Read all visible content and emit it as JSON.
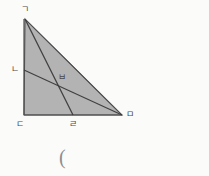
{
  "figure": {
    "background_color": "#fbfbfa",
    "fill_color": "#b3b3b3",
    "stroke_color": "#4f4f4f",
    "label_color": "#4a4a4a",
    "caption_color": "#8d8d8d",
    "width": 209,
    "height": 176
  },
  "labels": {
    "apex": "ㄱ",
    "left_leg_point": "ㄴ",
    "intersection": "ㅂ",
    "bottom_left": "ㄷ",
    "bottom_point": "ㄹ",
    "bottom_right": "ㅁ"
  },
  "caption": {
    "text": "("
  },
  "geometry": {
    "points": {
      "apex": {
        "name": "ㄱ",
        "x": 25,
        "y": 19
      },
      "bottom_left": {
        "name": "ㄷ",
        "x": 24,
        "y": 115
      },
      "bottom_right": {
        "name": "ㅁ",
        "x": 122,
        "y": 115
      },
      "left_leg_point": {
        "name": "ㄴ",
        "x": 24,
        "y": 70
      },
      "bottom_point": {
        "name": "ㄹ",
        "x": 73,
        "y": 115
      },
      "intersection": {
        "name": "ㅂ",
        "x": 62,
        "y": 82
      }
    },
    "triangle_vertices": "ㄱ ㄷ ㅁ",
    "segments": [
      {
        "name": "hypotenuse",
        "from": "ㄱ",
        "to": "ㅁ"
      },
      {
        "name": "left-leg",
        "from": "ㄱ",
        "to": "ㄷ"
      },
      {
        "name": "bottom-leg",
        "from": "ㄷ",
        "to": "ㅁ"
      },
      {
        "name": "cevian-apex-to-bottom-point",
        "from": "ㄱ",
        "to": "ㄹ"
      },
      {
        "name": "cevian-left-point-to-bottom-right",
        "from": "ㄴ",
        "to": "ㅁ"
      }
    ]
  }
}
